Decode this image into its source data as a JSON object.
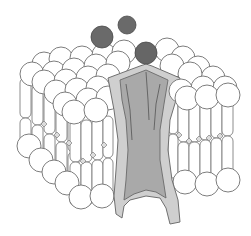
{
  "diagram": {
    "type": "lipid-bilayer-with-ion-channel",
    "colors": {
      "background": "#ffffff",
      "lipid_head": "#ffffff",
      "lipid_outline": "#6e6e6e",
      "ion": "#6a6a6a",
      "channel_outer": "#cfcfcf",
      "channel_inner": "#a9a9a9"
    },
    "ions": [
      {
        "cx": 102,
        "cy": 37,
        "r": 11
      },
      {
        "cx": 127,
        "cy": 25,
        "r": 9
      },
      {
        "cx": 146,
        "cy": 53,
        "r": 11
      }
    ],
    "labels": []
  }
}
